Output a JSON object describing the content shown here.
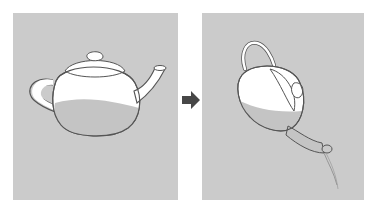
{
  "figure": {
    "panels": [
      {
        "id": "upright",
        "label": "",
        "subject": "teapot-upright-with-liquid"
      },
      {
        "id": "tilted",
        "label": "",
        "subject": "teapot-tilted-pouring"
      }
    ],
    "arrow": {
      "icon": "right-arrow-icon"
    }
  },
  "colors": {
    "panel_background": "#cbcbcb",
    "liquid": "#c4c4c4",
    "teapot_body": "#ffffff",
    "outline": "#555555",
    "arrow": "#474747"
  }
}
